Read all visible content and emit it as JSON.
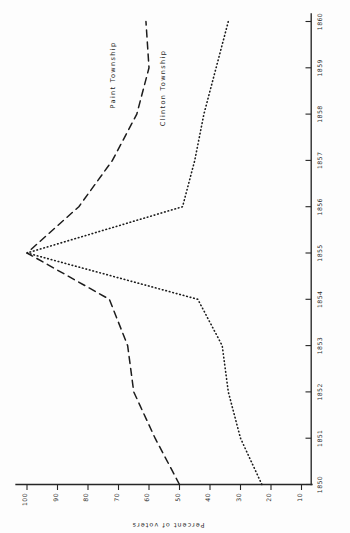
{
  "chart_data": {
    "type": "line",
    "title": "",
    "orientation": "rotated-90",
    "xlabel": "",
    "ylabel": "Percent of voters",
    "x": [
      1850,
      1851,
      1852,
      1853,
      1854,
      1855,
      1856,
      1857,
      1858,
      1859,
      1860
    ],
    "xticklabels": [
      "1850",
      "1851",
      "1852",
      "1853",
      "1854",
      "1855",
      "1856",
      "1857",
      "1858",
      "1859",
      "1860"
    ],
    "yticklabels": [
      "100",
      "90",
      "80",
      "70",
      "60",
      "50",
      "40",
      "30",
      "20",
      "10"
    ],
    "yticks": [
      100,
      90,
      80,
      70,
      60,
      50,
      40,
      30,
      20,
      10
    ],
    "xlim": [
      1850,
      1860
    ],
    "ylim": [
      0,
      105
    ],
    "grid": false,
    "legend_position": "inline-annotation",
    "series": [
      {
        "name": "Paint Township",
        "style": "dashed",
        "color": "#1c1c1c",
        "values": [
          50,
          58,
          65,
          67,
          73,
          100,
          83,
          72,
          64,
          60,
          61
        ]
      },
      {
        "name": "Clinton Township",
        "style": "dotted",
        "color": "#1c1c1c",
        "values": [
          23,
          30,
          34,
          36,
          44,
          100,
          49,
          45,
          42,
          38,
          34
        ]
      }
    ],
    "annotations": [
      {
        "text": "Paint Township",
        "series": "Paint Township"
      },
      {
        "text": "Clinton Township",
        "series": "Clinton Township"
      }
    ]
  },
  "axes": {
    "percent_axis_title": "Percent of voters",
    "percent_ticks": [
      "100",
      "90",
      "80",
      "70",
      "60",
      "50",
      "40",
      "30",
      "20",
      "10"
    ],
    "year_ticks": [
      "1850",
      "1851",
      "1852",
      "1853",
      "1854",
      "1855",
      "1856",
      "1857",
      "1858",
      "1859",
      "1860"
    ]
  },
  "labels": {
    "paint": "Paint Township",
    "clinton": "Clinton Township"
  }
}
